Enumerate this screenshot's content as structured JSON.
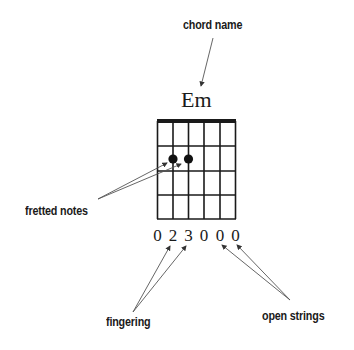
{
  "diagram": {
    "type": "guitar-chord-chart",
    "chord_name": "Em",
    "annotations": {
      "chord_name_label": "chord name",
      "fretted_notes_label": "fretted notes",
      "fingering_label": "fingering",
      "open_strings_label": "open strings"
    },
    "fingering": [
      "0",
      "2",
      "3",
      "0",
      "0",
      "0"
    ],
    "grid": {
      "strings": 6,
      "frets": 4
    },
    "fretted_notes": [
      {
        "string": 2,
        "fret": 1
      },
      {
        "string": 3,
        "fret": 1
      }
    ],
    "colors": {
      "ink": "#1a1a1a",
      "arrow": "#555555",
      "background": "#ffffff"
    }
  }
}
